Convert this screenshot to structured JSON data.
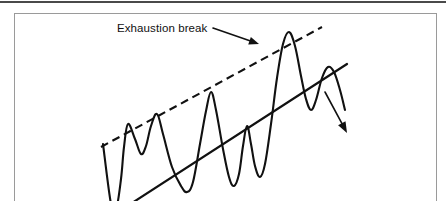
{
  "figure": {
    "annotation_label": "Exhaustion break",
    "colors": {
      "ink": "#111111",
      "box_border": "#9a9a9a",
      "top_rule": "#4a4a4a",
      "background": "#ffffff"
    }
  },
  "chart_data": {
    "type": "line",
    "title": "Exhaustion break",
    "subtitle": "",
    "xlabel": "",
    "ylabel": "",
    "grid": false,
    "legend": "none",
    "axis_visible": false,
    "xlim": [
      0,
      423
    ],
    "ylim": [
      0,
      240
    ],
    "annotations": [
      {
        "text": "Exhaustion break",
        "text_x": 117,
        "text_y": 30,
        "pointer_from": [
          198,
          14
        ],
        "pointer_to": [
          244,
          30
        ],
        "arrow": true
      }
    ],
    "series": [
      {
        "name": "price",
        "kind": "polyline-smooth",
        "stroke": "#111111",
        "points": [
          [
            88,
            130
          ],
          [
            96,
            190
          ],
          [
            101,
            196
          ],
          [
            106,
            165
          ],
          [
            109,
            133
          ],
          [
            113,
            110
          ],
          [
            120,
            125
          ],
          [
            126,
            140
          ],
          [
            131,
            132
          ],
          [
            136,
            112
          ],
          [
            142,
            100
          ],
          [
            148,
            120
          ],
          [
            157,
            153
          ],
          [
            166,
            172
          ],
          [
            172,
            178
          ],
          [
            178,
            168
          ],
          [
            185,
            130
          ],
          [
            191,
            97
          ],
          [
            196,
            78
          ],
          [
            201,
            96
          ],
          [
            208,
            135
          ],
          [
            214,
            163
          ],
          [
            219,
            172
          ],
          [
            224,
            160
          ],
          [
            228,
            132
          ],
          [
            232,
            112
          ],
          [
            236,
            130
          ],
          [
            240,
            152
          ],
          [
            245,
            163
          ],
          [
            250,
            150
          ],
          [
            256,
            110
          ],
          [
            262,
            64
          ],
          [
            268,
            30
          ],
          [
            274,
            18
          ],
          [
            280,
            32
          ],
          [
            286,
            62
          ],
          [
            291,
            85
          ],
          [
            296,
            96
          ],
          [
            301,
            86
          ],
          [
            307,
            64
          ],
          [
            313,
            53
          ],
          [
            319,
            58
          ],
          [
            325,
            76
          ],
          [
            330,
            96
          ]
        ]
      }
    ],
    "trendlines": [
      {
        "name": "upper-resistance-dashed",
        "style": "dashed",
        "x1": 86,
        "y1": 133,
        "x2": 307,
        "y2": 13
      },
      {
        "name": "lower-support-solid",
        "style": "solid",
        "x1": 100,
        "y1": 200,
        "x2": 332,
        "y2": 50
      }
    ],
    "breakdown_arrow": {
      "name": "breakdown-arrow",
      "x1": 310,
      "y1": 78,
      "x2": 332,
      "y2": 119,
      "arrowhead": true
    }
  }
}
